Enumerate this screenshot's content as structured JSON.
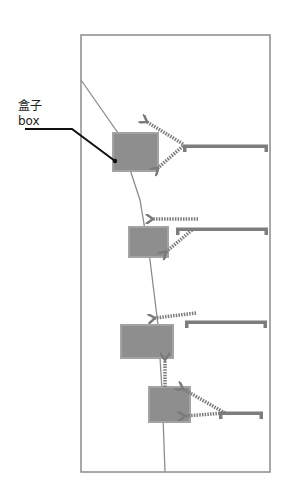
{
  "diagram": {
    "label_cn": "盒子",
    "label_en": "box",
    "colors": {
      "frame": "#8c8c8c",
      "curve": "#8c8c8c",
      "box_fill": "#8e8e8e",
      "box_stroke": "#a3a3a3",
      "rail": "#7d7d7d",
      "arrow": "#7a7a7a",
      "leader": "#111111"
    },
    "frame": {
      "x": 81,
      "y": 35,
      "w": 189,
      "h": 437
    },
    "curve": [
      [
        81,
        80
      ],
      [
        118,
        133
      ],
      [
        140,
        200
      ],
      [
        150,
        260
      ],
      [
        158,
        325
      ],
      [
        162,
        390
      ],
      [
        165,
        472
      ]
    ],
    "leader": {
      "points": [
        [
          25,
          129
        ],
        [
          72,
          129
        ],
        [
          115,
          161
        ]
      ]
    },
    "boxes": [
      {
        "x": 113,
        "y": 133,
        "w": 45,
        "h": 38
      },
      {
        "x": 129,
        "y": 227,
        "w": 39,
        "h": 30
      },
      {
        "x": 121,
        "y": 325,
        "w": 52,
        "h": 33
      },
      {
        "x": 149,
        "y": 387,
        "w": 41,
        "h": 35
      }
    ],
    "rails": [
      {
        "x1": 183,
        "x2": 268,
        "y": 146
      },
      {
        "x1": 176,
        "x2": 268,
        "y": 229
      },
      {
        "x1": 185,
        "x2": 267,
        "y": 322
      },
      {
        "x1": 219,
        "x2": 263,
        "y": 413
      }
    ],
    "arrows": [
      {
        "from": [
          183,
          144
        ],
        "to": [
          147,
          122
        ]
      },
      {
        "from": [
          183,
          146
        ],
        "to": [
          158,
          168
        ]
      },
      {
        "from": [
          198,
          219
        ],
        "to": [
          153,
          219
        ]
      },
      {
        "from": [
          192,
          230
        ],
        "to": [
          166,
          252
        ]
      },
      {
        "from": [
          196,
          313
        ],
        "to": [
          155,
          318
        ]
      },
      {
        "from": [
          165,
          387
        ],
        "to": [
          165,
          360
        ]
      },
      {
        "from": [
          225,
          413
        ],
        "to": [
          183,
          389
        ]
      },
      {
        "from": [
          225,
          413
        ],
        "to": [
          185,
          416
        ]
      }
    ]
  }
}
